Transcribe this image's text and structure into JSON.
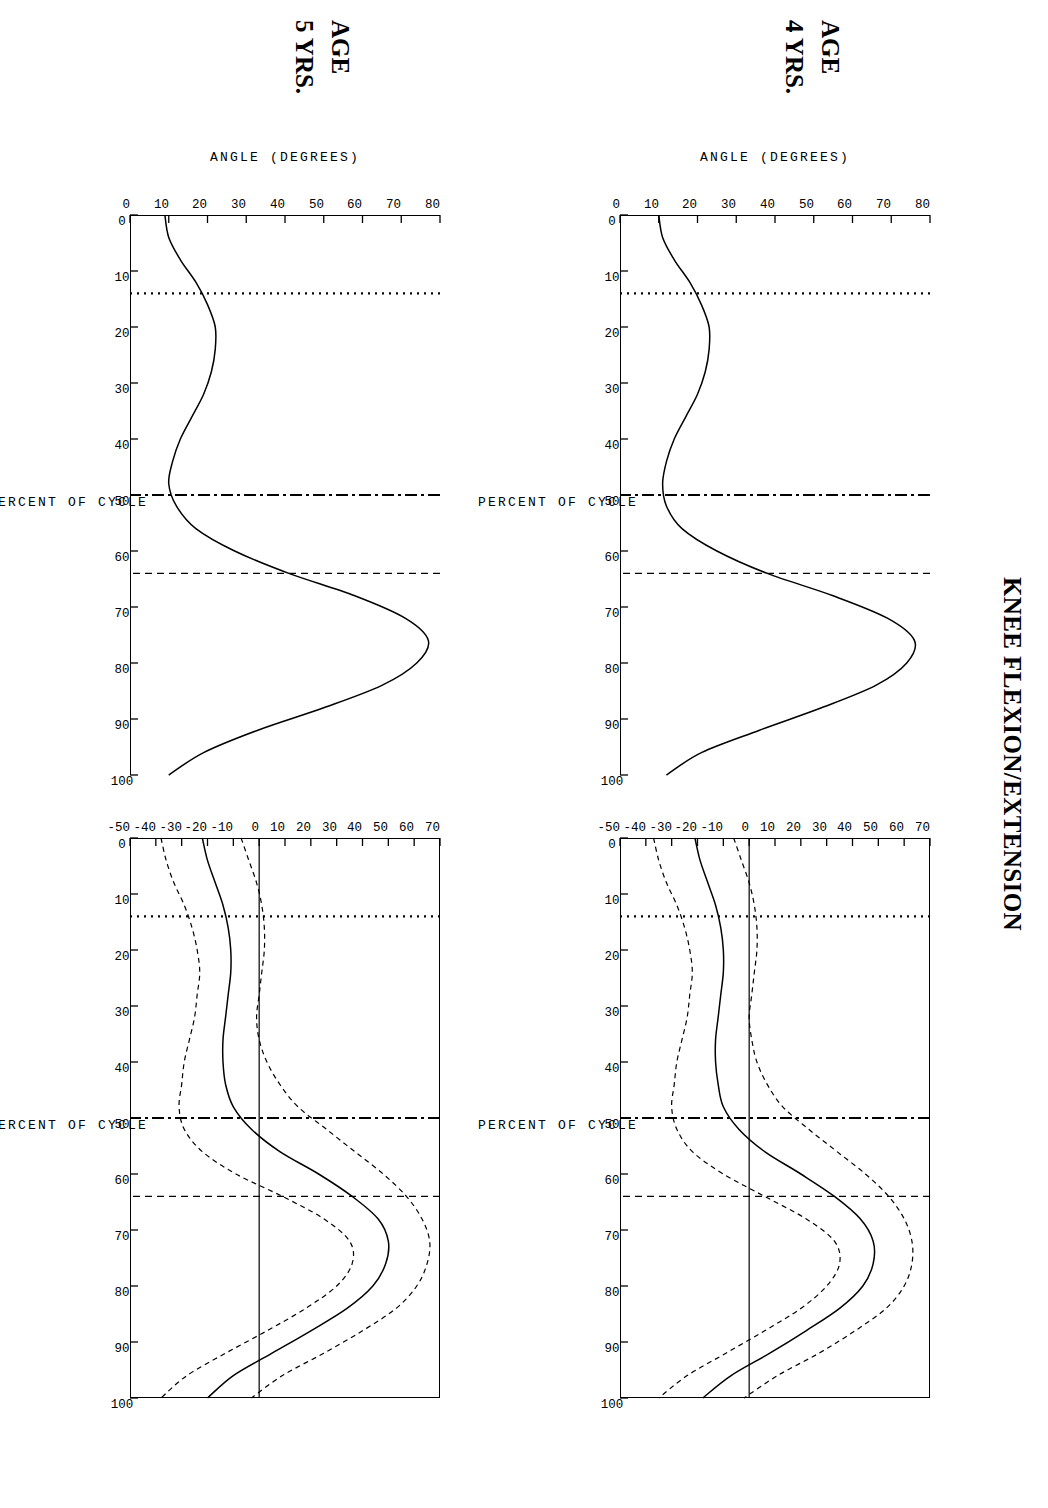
{
  "figure": {
    "title": "KNEE FLEXION/EXTENSION",
    "axis": {
      "x_title": "PERCENT OF CYCLE",
      "y_title": "ANGLE  (DEGREES)"
    },
    "rows": [
      {
        "age_label": "AGE",
        "years_label": "4 YRS."
      },
      {
        "age_label": "AGE",
        "years_label": "5 YRS."
      }
    ],
    "event_lines": [
      {
        "name": "opposite-foot-off",
        "style": "dotted",
        "percent": 14
      },
      {
        "name": "opposite-foot-contact",
        "style": "dash-dot",
        "percent": 50
      },
      {
        "name": "toe-off",
        "style": "dashed",
        "percent": 64
      }
    ]
  },
  "chart_data": [
    {
      "id": "age4-left",
      "type": "line",
      "title": "",
      "xlabel": "PERCENT OF CYCLE",
      "ylabel": "ANGLE  (DEGREES)",
      "xlim": [
        0,
        100
      ],
      "ylim": [
        0,
        80
      ],
      "xticks": [
        0,
        10,
        20,
        30,
        40,
        50,
        60,
        70,
        80,
        90,
        100
      ],
      "xticklabels": [
        "0",
        "10",
        "20",
        "30",
        "40",
        "50",
        "60",
        "70",
        "80",
        "90",
        "100"
      ],
      "yticks": [
        0,
        10,
        20,
        30,
        40,
        50,
        60,
        70,
        80
      ],
      "yticklabels": [
        "0",
        "10",
        "20",
        "30",
        "40",
        "50",
        "60",
        "70",
        "80"
      ],
      "grid": false,
      "legend": "none",
      "vlines": [
        {
          "x": 14,
          "style": "dotted"
        },
        {
          "x": 50,
          "style": "dash-dot"
        },
        {
          "x": 64,
          "style": "dashed"
        }
      ],
      "series": [
        {
          "name": "mean knee angle",
          "style": "solid",
          "x": [
            0,
            4,
            8,
            12,
            16,
            20,
            24,
            28,
            32,
            36,
            40,
            44,
            48,
            52,
            56,
            60,
            64,
            68,
            72,
            76,
            80,
            84,
            88,
            92,
            96,
            100
          ],
          "values": [
            10,
            11,
            14,
            18,
            21,
            23,
            23,
            22,
            20,
            17,
            14,
            12,
            11,
            12,
            16,
            25,
            38,
            55,
            69,
            76,
            74,
            66,
            52,
            36,
            21,
            12
          ]
        }
      ]
    },
    {
      "id": "age4-right",
      "type": "line",
      "title": "",
      "xlabel": "PERCENT OF CYCLE",
      "ylabel": "",
      "xlim": [
        0,
        100
      ],
      "ylim": [
        -50,
        70
      ],
      "xticks": [
        0,
        10,
        20,
        30,
        40,
        50,
        60,
        70,
        80,
        90,
        100
      ],
      "xticklabels": [
        "0",
        "10",
        "20",
        "30",
        "40",
        "50",
        "60",
        "70",
        "80",
        "90",
        "100"
      ],
      "yticks": [
        -50,
        -40,
        -30,
        -20,
        -10,
        0,
        10,
        20,
        30,
        40,
        50,
        60,
        70
      ],
      "yticklabels": [
        "-50",
        "-40",
        "-30",
        "-20",
        "-10",
        "0",
        "10",
        "20",
        "30",
        "40",
        "50",
        "60",
        "70"
      ],
      "grid": false,
      "legend": "none",
      "zero_line": true,
      "vlines": [
        {
          "x": 14,
          "style": "dotted"
        },
        {
          "x": 50,
          "style": "dash-dot"
        },
        {
          "x": 64,
          "style": "dashed"
        }
      ],
      "series": [
        {
          "name": "mean difference",
          "style": "solid",
          "x": [
            0,
            4,
            8,
            12,
            16,
            20,
            24,
            28,
            32,
            36,
            40,
            44,
            48,
            52,
            56,
            60,
            64,
            68,
            72,
            76,
            80,
            84,
            88,
            92,
            96,
            100
          ],
          "values": [
            -21,
            -19,
            -16,
            -13,
            -11,
            -10,
            -10,
            -11,
            -12,
            -13,
            -13,
            -12,
            -10,
            -4,
            6,
            20,
            33,
            43,
            48,
            48,
            44,
            35,
            22,
            8,
            -7,
            -18
          ]
        },
        {
          "name": "upper band (+1 SD)",
          "style": "dashed",
          "x": [
            0,
            4,
            8,
            12,
            16,
            20,
            24,
            28,
            32,
            36,
            40,
            44,
            48,
            52,
            56,
            60,
            64,
            68,
            72,
            76,
            80,
            84,
            88,
            92,
            96,
            100
          ],
          "values": [
            -6,
            -3,
            0,
            2,
            3,
            3,
            2,
            1,
            0,
            1,
            3,
            7,
            13,
            23,
            34,
            45,
            54,
            60,
            63,
            63,
            60,
            53,
            41,
            27,
            11,
            -2
          ]
        },
        {
          "name": "lower band (-1 SD)",
          "style": "dashed",
          "x": [
            0,
            4,
            8,
            12,
            16,
            20,
            24,
            28,
            32,
            36,
            40,
            44,
            48,
            52,
            56,
            60,
            64,
            68,
            72,
            76,
            80,
            84,
            88,
            92,
            96,
            100
          ],
          "values": [
            -37,
            -35,
            -32,
            -28,
            -25,
            -23,
            -22,
            -23,
            -24,
            -26,
            -28,
            -29,
            -30,
            -28,
            -22,
            -10,
            6,
            22,
            33,
            35,
            30,
            20,
            6,
            -9,
            -24,
            -35
          ]
        }
      ]
    },
    {
      "id": "age5-left",
      "type": "line",
      "title": "",
      "xlabel": "PERCENT OF CYCLE",
      "ylabel": "ANGLE  (DEGREES)",
      "xlim": [
        0,
        100
      ],
      "ylim": [
        0,
        80
      ],
      "xticks": [
        0,
        10,
        20,
        30,
        40,
        50,
        60,
        70,
        80,
        90,
        100
      ],
      "xticklabels": [
        "0",
        "10",
        "20",
        "30",
        "40",
        "50",
        "60",
        "70",
        "80",
        "90",
        "100"
      ],
      "yticks": [
        0,
        10,
        20,
        30,
        40,
        50,
        60,
        70,
        80
      ],
      "yticklabels": [
        "0",
        "10",
        "20",
        "30",
        "40",
        "50",
        "60",
        "70",
        "80"
      ],
      "grid": false,
      "legend": "none",
      "vlines": [
        {
          "x": 14,
          "style": "dotted"
        },
        {
          "x": 50,
          "style": "dash-dot"
        },
        {
          "x": 64,
          "style": "dashed"
        }
      ],
      "series": [
        {
          "name": "mean knee angle",
          "style": "solid",
          "x": [
            0,
            4,
            8,
            12,
            16,
            20,
            24,
            28,
            32,
            36,
            40,
            44,
            48,
            52,
            56,
            60,
            64,
            68,
            72,
            76,
            80,
            84,
            88,
            92,
            96,
            100
          ],
          "values": [
            9,
            10,
            13,
            17,
            20,
            22,
            22,
            21,
            19,
            16,
            13,
            11,
            10,
            12,
            17,
            27,
            41,
            58,
            71,
            77,
            74,
            65,
            50,
            33,
            19,
            10
          ]
        }
      ]
    },
    {
      "id": "age5-right",
      "type": "line",
      "title": "",
      "xlabel": "PERCENT OF CYCLE",
      "ylabel": "",
      "xlim": [
        0,
        100
      ],
      "ylim": [
        -50,
        70
      ],
      "xticks": [
        0,
        10,
        20,
        30,
        40,
        50,
        60,
        70,
        80,
        90,
        100
      ],
      "xticklabels": [
        "0",
        "10",
        "20",
        "30",
        "40",
        "50",
        "60",
        "70",
        "80",
        "90",
        "100"
      ],
      "yticks": [
        -50,
        -40,
        -30,
        -20,
        -10,
        0,
        10,
        20,
        30,
        40,
        50,
        60,
        70
      ],
      "yticklabels": [
        "-50",
        "-40",
        "-30",
        "-20",
        "-10",
        "0",
        "10",
        "20",
        "30",
        "40",
        "50",
        "60",
        "70"
      ],
      "grid": false,
      "legend": "none",
      "zero_line": true,
      "vlines": [
        {
          "x": 14,
          "style": "dotted"
        },
        {
          "x": 50,
          "style": "dash-dot"
        },
        {
          "x": 64,
          "style": "dashed"
        }
      ],
      "series": [
        {
          "name": "mean difference",
          "style": "solid",
          "x": [
            0,
            4,
            8,
            12,
            16,
            20,
            24,
            28,
            32,
            36,
            40,
            44,
            48,
            52,
            56,
            60,
            64,
            68,
            72,
            76,
            80,
            84,
            88,
            92,
            96,
            100
          ],
          "values": [
            -22,
            -20,
            -17,
            -14,
            -12,
            -11,
            -11,
            -12,
            -13,
            -14,
            -14,
            -13,
            -10,
            -3,
            8,
            23,
            36,
            46,
            50,
            49,
            44,
            34,
            20,
            5,
            -10,
            -20
          ]
        },
        {
          "name": "upper band (+1 SD)",
          "style": "dashed",
          "x": [
            0,
            4,
            8,
            12,
            16,
            20,
            24,
            28,
            32,
            36,
            40,
            44,
            48,
            52,
            56,
            60,
            64,
            68,
            72,
            76,
            80,
            84,
            88,
            92,
            96,
            100
          ],
          "values": [
            -7,
            -4,
            -1,
            1,
            2,
            2,
            1,
            0,
            -1,
            0,
            3,
            8,
            15,
            26,
            37,
            48,
            57,
            63,
            66,
            65,
            61,
            53,
            40,
            25,
            9,
            -3
          ]
        },
        {
          "name": "lower band (-1 SD)",
          "style": "dashed",
          "x": [
            0,
            4,
            8,
            12,
            16,
            20,
            24,
            28,
            32,
            36,
            40,
            44,
            48,
            52,
            56,
            60,
            64,
            68,
            72,
            76,
            80,
            84,
            88,
            92,
            96,
            100
          ],
          "values": [
            -38,
            -36,
            -33,
            -29,
            -26,
            -24,
            -23,
            -24,
            -25,
            -27,
            -29,
            -30,
            -31,
            -29,
            -22,
            -9,
            9,
            25,
            35,
            36,
            30,
            18,
            3,
            -13,
            -28,
            -38
          ]
        }
      ]
    }
  ]
}
